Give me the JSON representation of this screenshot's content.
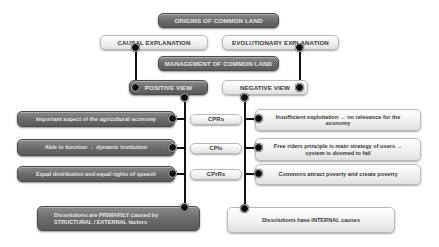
{
  "diagram": {
    "title": "ORIGINS OF COMMON LAND",
    "explanations": {
      "causal": "CAUSAL EXPLANATION",
      "evolutionary": "EVOLUTIONARY EXPLANATION"
    },
    "management": "MANAGEMENT OF COMMON LAND",
    "views": {
      "positive": "POSITIVE VIEW",
      "negative": "NEGATIVE VIEW"
    },
    "rows": [
      {
        "positive": "Important aspect of the agricultural economy",
        "label": "CPRs",
        "negative": "Insufficient exploitation → no relevance for the economy"
      },
      {
        "positive": "Able to function → dynamic institution",
        "label": "CPIs",
        "negative": "Free riders principle is main strategy of users → system is doomed to fail"
      },
      {
        "positive": "Equal distribution and equal rights of speech",
        "label": "CPrRs",
        "negative": "Commons attract poverty and create poverty"
      }
    ],
    "conclusions": {
      "positive_line1": "Dissolutions are PRIMARILY caused by",
      "positive_line2": "STRUCTURAL / EXTERNAL factors",
      "negative": "Dissolutions have INTERNAL causes"
    },
    "colors": {
      "dark_box": "#6a6a6a",
      "light_box": "#f2f2f2",
      "connector": "#111111"
    }
  }
}
